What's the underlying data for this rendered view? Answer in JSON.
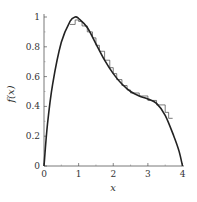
{
  "chart_data": {
    "type": "line",
    "title": "",
    "xlabel": "x",
    "ylabel": "f(x)",
    "xlim": [
      0,
      4
    ],
    "ylim": [
      0,
      1
    ],
    "xticks": [
      "0",
      "1",
      "2",
      "3",
      "4"
    ],
    "yticks": [
      "0",
      "0.2",
      "0.4",
      "0.6",
      "0.8",
      "1"
    ],
    "grid": false,
    "legend": null,
    "series": [
      {
        "name": "f(x) smooth",
        "style": "solid",
        "color": "#222222",
        "x": [
          0,
          0.1,
          0.25,
          0.5,
          0.75,
          0.9,
          1.0,
          1.25,
          1.5,
          1.75,
          2.0,
          2.25,
          2.5,
          2.75,
          3.0,
          3.25,
          3.5,
          3.75,
          3.9,
          4.0
        ],
        "y": [
          0,
          0.28,
          0.55,
          0.83,
          0.97,
          1.0,
          0.99,
          0.93,
          0.82,
          0.71,
          0.62,
          0.55,
          0.5,
          0.47,
          0.45,
          0.42,
          0.34,
          0.2,
          0.1,
          0
        ]
      },
      {
        "name": "f(x) staircase approximation",
        "style": "step",
        "color": "#444444",
        "x": [
          0.75,
          0.9,
          1.0,
          1.1,
          1.25,
          1.4,
          1.5,
          1.6,
          1.75,
          1.9,
          2.0,
          2.1,
          2.25,
          2.4,
          2.5,
          2.75,
          3.0,
          3.25,
          3.5,
          3.6
        ],
        "y": [
          0.95,
          0.98,
          0.97,
          0.94,
          0.9,
          0.86,
          0.81,
          0.77,
          0.71,
          0.66,
          0.62,
          0.58,
          0.54,
          0.51,
          0.49,
          0.47,
          0.44,
          0.41,
          0.36,
          0.32
        ]
      }
    ]
  },
  "axes": {
    "xlabel": "x",
    "ylabel": "f(x)",
    "xtick_labels": [
      "0",
      "1",
      "2",
      "3",
      "4"
    ],
    "ytick_labels": [
      "0",
      "0.2",
      "0.4",
      "0.6",
      "0.8",
      "1"
    ]
  }
}
